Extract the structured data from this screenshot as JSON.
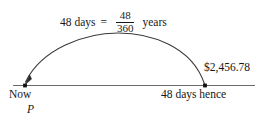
{
  "diagram": {
    "type": "timeline-with-arc",
    "title_equation": {
      "lhs": "48 days",
      "operator": "=",
      "fraction": {
        "numerator": "48",
        "denominator": "360"
      },
      "rhs": "years"
    },
    "timeline": {
      "start_label": "Now",
      "start_symbol": "P",
      "end_label": "48 days hence",
      "end_value": "$2,456.78",
      "line_color": "#555555",
      "point_color": "#111111"
    },
    "arc": {
      "direction": "right-to-left",
      "arrow_at": "start",
      "stroke_color": "#333333"
    }
  }
}
